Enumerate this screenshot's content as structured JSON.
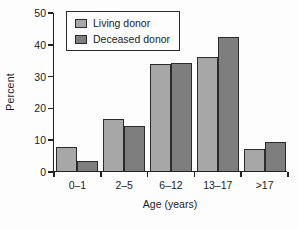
{
  "chart_data": {
    "type": "bar",
    "title": "",
    "categories": [
      "0–1",
      "2–5",
      "6–12",
      "13–17",
      ">17"
    ],
    "series": [
      {
        "name": "Living donor",
        "color": "#a7a7a7",
        "values": [
          7.5,
          16.5,
          33.5,
          36,
          7
        ]
      },
      {
        "name": "Deceased donor",
        "color": "#7e7e7e",
        "values": [
          3,
          14,
          34,
          42,
          9
        ]
      }
    ],
    "xlabel": "Age (years)",
    "ylabel": "Percent",
    "ylim": [
      0,
      50
    ],
    "yticks": [
      0,
      10,
      20,
      30,
      40,
      50
    ],
    "grid": false,
    "legend_position": "top-left",
    "bar_outline_color": "#2b2b2b",
    "axis_color": "#222222"
  }
}
